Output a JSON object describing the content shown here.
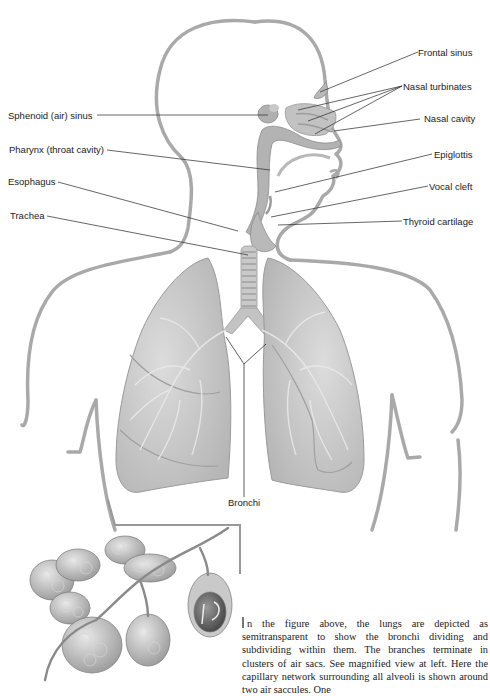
{
  "figure": {
    "labels": {
      "frontal_sinus": "Frontal sinus",
      "nasal_turbinates": "Nasal turbinates",
      "nasal_cavity": "Nasal cavity",
      "sphenoid_sinus": "Sphenoid (air) sinus",
      "pharynx": "Pharynx (throat cavity)",
      "epiglottis": "Epiglottis",
      "esophagus": "Esophagus",
      "vocal_cleft": "Vocal cleft",
      "trachea": "Trachea",
      "thyroid_cartilage": "Thyroid cartilage",
      "bronchi": "Bronchi"
    },
    "inset": {
      "subject": "Magnified alveoli air sacs with capillary network"
    }
  },
  "caption": {
    "drop_initial": "I",
    "text": "n the figure above, the lungs are depicted as semitransparent to show the bronchi dividing and subdividing within them. The branches terminate in clusters of air sacs. See magnified view at left. Here the capillary network surrounding all alveoli is shown around two air saccules. One"
  },
  "colors": {
    "outline": "#a9a9a9",
    "lung_fill": "#cfcfcf",
    "lung_shade": "#b4b4b4",
    "leader_line": "#333333",
    "text": "#222222"
  }
}
